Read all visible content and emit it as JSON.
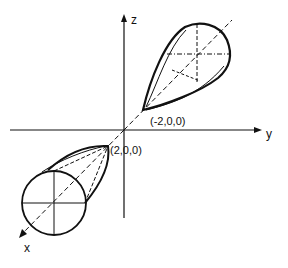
{
  "diagram": {
    "type": "3d-axes-lobes",
    "axes": {
      "z": {
        "label": "z"
      },
      "y": {
        "label": "y"
      },
      "x": {
        "label": "x"
      }
    },
    "points": [
      {
        "label": "(-2,0,0)",
        "role": "lobe-tip-upper"
      },
      {
        "label": "(2,0,0)",
        "role": "lobe-tip-lower"
      }
    ],
    "colors": {
      "stroke": "#111111",
      "background": "#ffffff"
    }
  }
}
